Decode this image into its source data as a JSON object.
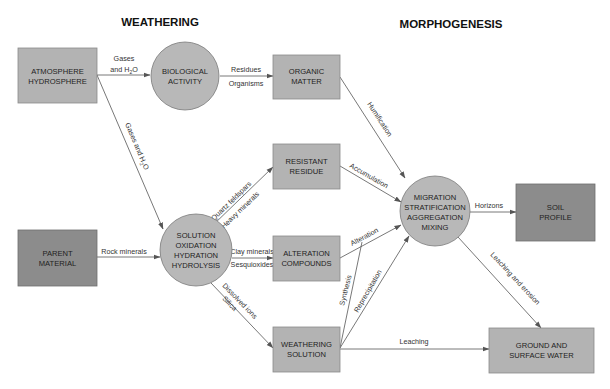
{
  "titles": {
    "weathering": "WEATHERING",
    "morphogenesis": "MORPHOGENESIS"
  },
  "colors": {
    "box_light": "#b3b3b3",
    "box_dark": "#8a8a8a",
    "circle": "#b8b8b8",
    "stroke": "#777777",
    "edge": "#555555"
  },
  "nodes": {
    "atmosphere": {
      "line1": "ATMOSPHERE",
      "line2": "HYDROSPHERE",
      "shape": "box"
    },
    "biological": {
      "line1": "BIOLOGICAL",
      "line2": "ACTIVITY",
      "shape": "circle"
    },
    "organic": {
      "line1": "ORGANIC",
      "line2": "MATTER",
      "shape": "box"
    },
    "resistant": {
      "line1": "RESISTANT",
      "line2": "RESIDUE",
      "shape": "box"
    },
    "parent": {
      "line1": "PARENT",
      "line2": "MATERIAL",
      "shape": "box-dark"
    },
    "solution": {
      "line1": "SOLUTION",
      "line2": "OXIDATION",
      "line3": "HYDRATION",
      "line4": "HYDROLYSIS",
      "shape": "circle"
    },
    "alteration": {
      "line1": "ALTERATION",
      "line2": "COMPOUNDS",
      "shape": "box"
    },
    "migration": {
      "line1": "MIGRATION",
      "line2": "STRATIFICATION",
      "line3": "AGGREGATION",
      "line4": "MIXING",
      "shape": "circle"
    },
    "soil": {
      "line1": "SOIL",
      "line2": "PROFILE",
      "shape": "box-dark"
    },
    "weathering_solution": {
      "line1": "WEATHERING",
      "line2": "SOLUTION",
      "shape": "box"
    },
    "ground": {
      "line1": "GROUND AND",
      "line2": "SURFACE WATER",
      "shape": "box"
    }
  },
  "edges": {
    "atm_bio": {
      "label1": "Gases",
      "label2_pre": "and H",
      "label2_sub": "2",
      "label2_post": "O"
    },
    "atm_sol": {
      "label_pre": "Gases and H",
      "label_sub": "2",
      "label_post": "O"
    },
    "bio_org": {
      "label1": "Residues",
      "label2": "Organisms"
    },
    "par_sol": {
      "label": "Rock minerals"
    },
    "sol_res": {
      "label1": "Quartz feldspars",
      "label2": "Heavy minerals"
    },
    "sol_alt": {
      "label1": "Clay minerals",
      "label2": "Sesquioxides"
    },
    "sol_ws": {
      "label1": "Dissolved ions",
      "label2": "Silica"
    },
    "org_mig": {
      "label": "Humification"
    },
    "res_mig": {
      "label": "Accumulation"
    },
    "alt_mig": {
      "label": "Alteration"
    },
    "ws_alt": {
      "label": "Synthesis"
    },
    "ws_mig": {
      "label": "Reprecipitation"
    },
    "mig_soil": {
      "label": "Horizons"
    },
    "mig_ground": {
      "label": "Leaching and erosion"
    },
    "ws_ground": {
      "label": "Leaching"
    }
  }
}
